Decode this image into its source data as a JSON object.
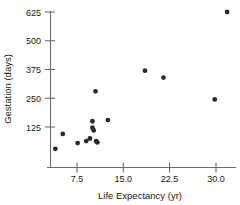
{
  "chart_data": {
    "type": "scatter",
    "title": "",
    "xlabel": "Life Expectancy (yr)",
    "ylabel": "Gestation (days)",
    "xlim": [
      3.0,
      34.0
    ],
    "ylim": [
      0,
      660
    ],
    "xticks": [
      7.5,
      15.0,
      22.5,
      30.0
    ],
    "xtick_labels": [
      "7.5",
      "15.0",
      "22.5",
      "30.0"
    ],
    "yticks": [
      125,
      250,
      375,
      500,
      625
    ],
    "ytick_labels": [
      "125",
      "250",
      "375",
      "500",
      "625"
    ],
    "grid": false,
    "legend": false,
    "marker": "filled-circle",
    "marker_color": "#2a2a2a",
    "points": [
      {
        "x": 4.0,
        "y": 30
      },
      {
        "x": 5.2,
        "y": 95
      },
      {
        "x": 7.6,
        "y": 55
      },
      {
        "x": 9.0,
        "y": 64
      },
      {
        "x": 9.6,
        "y": 75
      },
      {
        "x": 10.0,
        "y": 150
      },
      {
        "x": 10.0,
        "y": 122
      },
      {
        "x": 10.2,
        "y": 110
      },
      {
        "x": 10.6,
        "y": 63
      },
      {
        "x": 10.8,
        "y": 58
      },
      {
        "x": 10.5,
        "y": 280
      },
      {
        "x": 12.5,
        "y": 155
      },
      {
        "x": 18.5,
        "y": 370
      },
      {
        "x": 21.5,
        "y": 340
      },
      {
        "x": 29.8,
        "y": 245
      },
      {
        "x": 31.8,
        "y": 625
      }
    ]
  },
  "axis": {
    "x_title": "Life Expectancy (yr)",
    "y_title": "Gestation (days)"
  },
  "tick_text": {
    "y": [
      "625",
      "500",
      "375",
      "250",
      "125"
    ],
    "x": [
      "7.5",
      "15.0",
      "22.5",
      "30.0"
    ]
  }
}
